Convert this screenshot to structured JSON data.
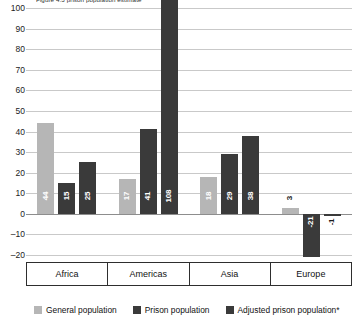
{
  "chart_data": {
    "type": "bar",
    "title": "Figure 4.3   prison population estimate",
    "categories": [
      "Africa",
      "Americas",
      "Asia",
      "Europe"
    ],
    "series": [
      {
        "name": "General population",
        "color": "#b6b6b6",
        "values": [
          44,
          17,
          18,
          3
        ]
      },
      {
        "name": "Prison population",
        "color": "#3a3a3a",
        "values": [
          15,
          41,
          29,
          -21
        ]
      },
      {
        "name": "Adjusted prison population*",
        "color": "#3a3a3a",
        "values": [
          25,
          108,
          38,
          -1
        ]
      }
    ],
    "point_labels": [
      [
        "44",
        "15",
        "25"
      ],
      [
        "17",
        "41",
        "108"
      ],
      [
        "18",
        "29",
        "38"
      ],
      [
        "3",
        "-21",
        "-1"
      ]
    ],
    "ylim": [
      -20,
      100
    ],
    "yticks": [
      100,
      90,
      80,
      70,
      60,
      50,
      40,
      30,
      20,
      10,
      0,
      -10,
      -20
    ],
    "ytick_labels": [
      "100",
      "90",
      "80",
      "70",
      "60",
      "50",
      "40",
      "30",
      "20",
      "10",
      "0",
      "–10",
      "–20"
    ],
    "xlabel": "",
    "ylabel": "",
    "grid": true,
    "legend_position": "bottom"
  },
  "legend": {
    "items": [
      {
        "label": "General population"
      },
      {
        "label": "Prison population"
      },
      {
        "label": "Adjusted prison population*"
      }
    ]
  }
}
